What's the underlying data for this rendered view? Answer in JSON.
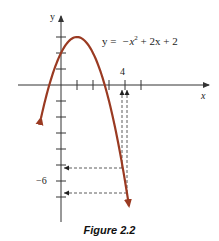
{
  "figure": {
    "caption": "Figure 2.2",
    "equation_lhs": "y",
    "equation_eq": "=",
    "equation_rhs_pre": "−x",
    "equation_exp": "2",
    "equation_rhs_post": "+ 2x + 2",
    "x_axis_label": "x",
    "y_axis_label": "y",
    "x_tick_label": "4",
    "y_tick_label": "−6",
    "colors": {
      "curve": "#9a3a22",
      "axis": "#333333",
      "dash": "#333333"
    }
  },
  "chart_data": {
    "type": "line",
    "title": "",
    "caption": "Figure 2.2",
    "series": [
      {
        "name": "y = -x^2 + 2x + 2",
        "function": "-x^2+2x+2",
        "x": [
          -1.25,
          -1,
          0,
          1,
          2,
          3,
          4,
          4.25
        ],
        "values": [
          -2.06,
          -1,
          2,
          3,
          2,
          -1,
          -6,
          -7.56
        ]
      }
    ],
    "annotations": [
      {
        "type": "dashed-projection",
        "x": 3.9,
        "y": -5.2
      },
      {
        "type": "dashed-projection",
        "x": 4.1,
        "y": -6.8
      }
    ],
    "xlabel": "x",
    "ylabel": "y",
    "x_ticks": [
      1,
      2,
      3,
      4,
      5
    ],
    "x_tick_labels_shown": {
      "4": "4"
    },
    "y_ticks": [
      3,
      2,
      1,
      -1,
      -2,
      -3,
      -4,
      -5,
      -6,
      -7
    ],
    "y_tick_labels_shown": {
      "-6": "−6"
    },
    "xlim": [
      -2.5,
      8.5
    ],
    "ylim": [
      -9,
      4.5
    ],
    "grid": false,
    "legend": "none"
  }
}
